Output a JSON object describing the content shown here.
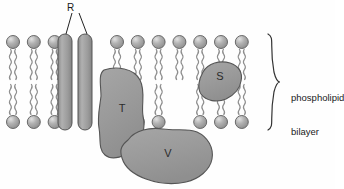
{
  "figure": {
    "type": "cell-membrane-fluid-mosaic-diagram",
    "background_color": "#fefefe"
  },
  "labels": {
    "receptor": "R",
    "bilayer_line1": "phospholipid",
    "bilayer_line2": "bilayer"
  },
  "proteins": [
    {
      "id": "R",
      "letter": "R",
      "kind": "transmembrane-rod",
      "count": 2,
      "x": 58,
      "y": 34,
      "width": 14,
      "height": 96
    },
    {
      "id": "T",
      "letter": "T",
      "kind": "integral-blob",
      "cx": 122,
      "cy": 112
    },
    {
      "id": "S",
      "letter": "S",
      "kind": "peripheral-blob",
      "cx": 220,
      "cy": 80
    },
    {
      "id": "V",
      "letter": "V",
      "kind": "peripheral-blob",
      "cx": 168,
      "cy": 157
    }
  ],
  "lipids": {
    "head_count_top": 15,
    "head_count_bottom": 15,
    "head_radius": 6.5,
    "spacing": 20.8,
    "top_head_y": 42,
    "bottom_head_y": 122,
    "leaflet_gap_y": 82
  },
  "colors": {
    "protein_fill": "#9a9a9a",
    "protein_stroke": "#555555",
    "head_fill": "#a8a8a8",
    "head_highlight": "#d8d8d8",
    "head_stroke": "#5e5e5e",
    "tail_stroke": "#8e8e8e",
    "text": "#1a1a1a",
    "brace": "#333333"
  },
  "brace": {
    "x": 268,
    "top": 34,
    "bottom": 130
  }
}
